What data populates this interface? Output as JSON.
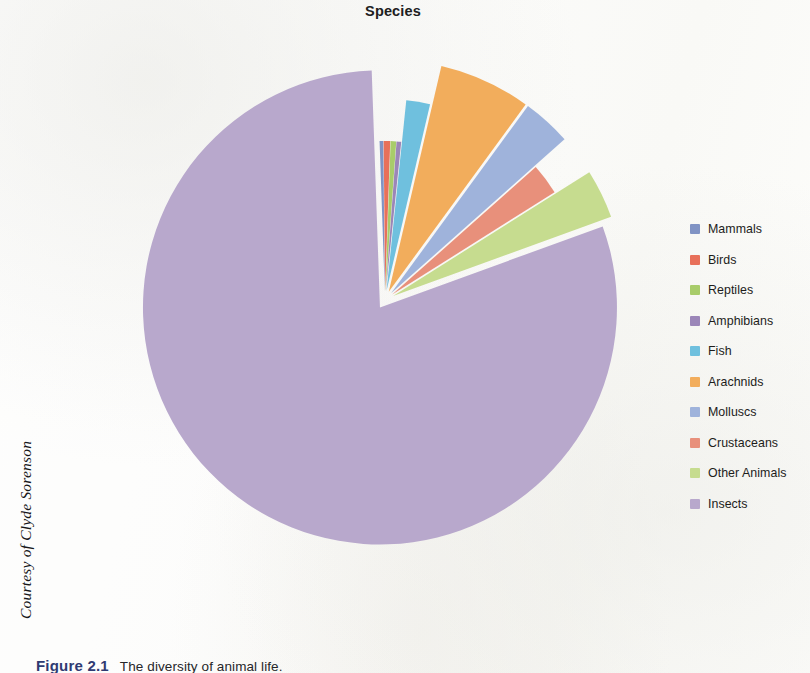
{
  "figure": {
    "credit": "Courtesy of Clyde Sorenson",
    "caption_label": "Figure 2.1",
    "caption_text": "The diversity of animal life."
  },
  "chart_data": {
    "type": "pie",
    "title": "Species",
    "exploded": true,
    "legend_position": "right",
    "categories": [
      "Mammals",
      "Birds",
      "Reptiles",
      "Amphibians",
      "Fish",
      "Arachnids",
      "Molluscs",
      "Crustaceans",
      "Other Animals",
      "Insects"
    ],
    "values": [
      0.4,
      0.7,
      0.6,
      0.5,
      2.0,
      6.4,
      3.4,
      2.6,
      3.4,
      80.0
    ],
    "unit": "percent",
    "colors": [
      "#8093c4",
      "#e8705a",
      "#a8cc6a",
      "#9b86b8",
      "#6fc0de",
      "#f2ad5c",
      "#9fb3db",
      "#e8907b",
      "#c6dc8f",
      "#b8a8cc"
    ],
    "series": [
      {
        "name": "Mammals",
        "value": 0.4,
        "color": "#8093c4"
      },
      {
        "name": "Birds",
        "value": 0.7,
        "color": "#e8705a"
      },
      {
        "name": "Reptiles",
        "value": 0.6,
        "color": "#a8cc6a"
      },
      {
        "name": "Amphibians",
        "value": 0.5,
        "color": "#9b86b8"
      },
      {
        "name": "Fish",
        "value": 2.0,
        "color": "#6fc0de"
      },
      {
        "name": "Arachnids",
        "value": 6.4,
        "color": "#f2ad5c"
      },
      {
        "name": "Molluscs",
        "value": 3.4,
        "color": "#9fb3db"
      },
      {
        "name": "Crustaceans",
        "value": 2.6,
        "color": "#e8907b"
      },
      {
        "name": "Other Animals",
        "value": 3.4,
        "color": "#c6dc8f"
      },
      {
        "name": "Insects",
        "value": 80.0,
        "color": "#b8a8cc"
      }
    ]
  }
}
